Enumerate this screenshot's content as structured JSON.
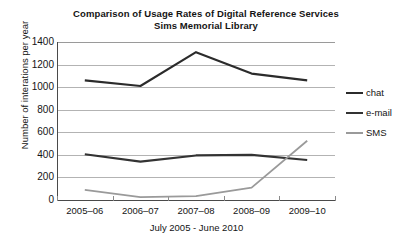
{
  "chart_data": {
    "type": "line",
    "title": "Comparison of Usage Rates of Digital Reference Services",
    "subtitle": "Sims Memorial Library",
    "xlabel": "July 2005 - June 2010",
    "ylabel": "Number of interations per year",
    "categories": [
      "2005–06",
      "2006–07",
      "2007–08",
      "2008–09",
      "2009–10"
    ],
    "ylim": [
      0,
      1400
    ],
    "ytick_step": 200,
    "yticks": [
      0,
      200,
      400,
      600,
      800,
      1000,
      1200,
      1400
    ],
    "ytick_labels": [
      "0",
      "200",
      "400",
      "600",
      "800",
      "1000",
      "1200",
      "1400"
    ],
    "grid": true,
    "legend_position": "right",
    "series": [
      {
        "name": "chat",
        "color": "#2b2b2b",
        "values": [
          1060,
          1010,
          1310,
          1120,
          1060
        ]
      },
      {
        "name": "e-mail",
        "color": "#333333",
        "values": [
          405,
          340,
          395,
          400,
          355
        ]
      },
      {
        "name": "SMS",
        "color": "#9a9a9a",
        "values": [
          90,
          25,
          35,
          110,
          525
        ]
      }
    ]
  },
  "legend": {
    "items": [
      {
        "label": "chat",
        "color": "#2b2b2b"
      },
      {
        "label": "e-mail",
        "color": "#333333"
      },
      {
        "label": "SMS",
        "color": "#9a9a9a"
      }
    ]
  }
}
